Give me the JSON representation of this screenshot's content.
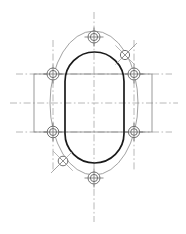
{
  "drawing": {
    "title": "Obround Flange Bolt Pattern",
    "view_label": "Front View",
    "background_color": "#ffffff",
    "canvas": {
      "width": 186,
      "height": 234
    },
    "center": {
      "x": 94,
      "y": 103
    }
  },
  "styles": {
    "outline_color": "#1a1a1a",
    "outline_width": 1.7,
    "construction_color": "#9a9a9a",
    "construction_width": 0.8,
    "centerline_color": "#b0b0b0",
    "centerline_width": 0.9,
    "hole_color": "#707070",
    "hole_width": 1.0,
    "rect_color": "#808080",
    "rect_width": 0.8,
    "bolt_circle_color": "#8a8a8a",
    "bolt_circle_width": 0.8
  },
  "obround": {
    "name": "obround-outline",
    "left": 65,
    "right": 124,
    "top": 52,
    "bottom": 163,
    "corner_radius": 29.5,
    "width": 59,
    "height": 111
  },
  "bolt_circle": {
    "name": "bolt-circle",
    "center_x": 94,
    "center_y": 103,
    "radius_x": 44,
    "radius_y": 72,
    "hole_count": 8
  },
  "holes": [
    {
      "id": "hole-top-center",
      "label": "Hole 1",
      "x": 94,
      "y": 37,
      "r_outer": 6.0,
      "r_inner": 3.6,
      "style": "ring",
      "tick_angle": 0
    },
    {
      "id": "hole-upper-right",
      "label": "Hole 2",
      "x": 125,
      "y": 55,
      "r_outer": 4.6,
      "r_inner": 0,
      "style": "cross",
      "tick_angle": 45
    },
    {
      "id": "hole-right-upper",
      "label": "Hole 3",
      "x": 134,
      "y": 74,
      "r_outer": 6.0,
      "r_inner": 3.6,
      "style": "ring",
      "tick_angle": 0
    },
    {
      "id": "hole-right-lower",
      "label": "Hole 4",
      "x": 134,
      "y": 132,
      "r_outer": 5.6,
      "r_inner": 3.3,
      "style": "ring",
      "tick_angle": 0
    },
    {
      "id": "hole-bottom-center",
      "label": "Hole 5",
      "x": 94,
      "y": 178,
      "r_outer": 6.0,
      "r_inner": 3.6,
      "style": "ring",
      "tick_angle": 0
    },
    {
      "id": "hole-lower-left",
      "label": "Hole 6",
      "x": 63,
      "y": 161,
      "r_outer": 4.8,
      "r_inner": 0,
      "style": "cross",
      "tick_angle": 45
    },
    {
      "id": "hole-left-lower",
      "label": "Hole 7",
      "x": 53,
      "y": 132,
      "r_outer": 5.8,
      "r_inner": 3.5,
      "style": "ring",
      "tick_angle": 0
    },
    {
      "id": "hole-left-upper",
      "label": "Hole 8",
      "x": 53,
      "y": 74,
      "r_outer": 6.0,
      "r_inner": 3.6,
      "style": "ring",
      "tick_angle": 0
    }
  ],
  "projection_rect": {
    "name": "projection-band",
    "left": 34,
    "right": 152,
    "top": 74,
    "bottom": 132
  },
  "centerlines": {
    "vertical": {
      "x": 94,
      "y1": 12,
      "y2": 222
    },
    "horizontal_main": {
      "y": 103,
      "x1": 10,
      "x2": 178
    },
    "horizontal_upper": {
      "y": 74,
      "x1": 16,
      "x2": 172
    },
    "horizontal_lower": {
      "y": 132,
      "x1": 16,
      "x2": 172
    },
    "vertical_left_holes": {
      "x": 53,
      "y1": 40,
      "y2": 170
    },
    "vertical_right_holes": {
      "x": 134,
      "y1": 40,
      "y2": 170
    }
  },
  "leader_lines": [
    {
      "id": "leader-upper-right",
      "x1": 125,
      "y1": 55,
      "x2": 137,
      "y2": 43
    },
    {
      "id": "leader-lower-left",
      "x1": 63,
      "y1": 161,
      "x2": 51,
      "y2": 173
    }
  ]
}
